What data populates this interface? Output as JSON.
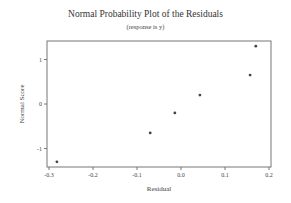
{
  "chart_data": {
    "type": "scatter",
    "title": "Normal Probability Plot of the Residuals",
    "subtitle": "(response is y)",
    "xlabel": "Residual",
    "ylabel": "Normal Score",
    "xlim": [
      -0.3,
      0.2
    ],
    "ylim": [
      -1.4,
      1.4
    ],
    "xticks": [
      -0.3,
      -0.2,
      -0.1,
      0.0,
      0.1,
      0.2
    ],
    "xtick_labels": [
      "-0.3",
      "-0.2",
      "-0.1",
      "0.0",
      "0.1",
      "0.2"
    ],
    "yticks": [
      -1,
      0,
      1
    ],
    "ytick_labels": [
      "-1",
      "0",
      "1"
    ],
    "grid": false,
    "legend": null,
    "series": [
      {
        "name": "Residuals",
        "x": [
          -0.282,
          -0.07,
          -0.014,
          0.043,
          0.157,
          0.17
        ],
        "y": [
          -1.3,
          -0.65,
          -0.2,
          0.2,
          0.65,
          1.3
        ]
      }
    ],
    "marker_color": "#444444"
  }
}
